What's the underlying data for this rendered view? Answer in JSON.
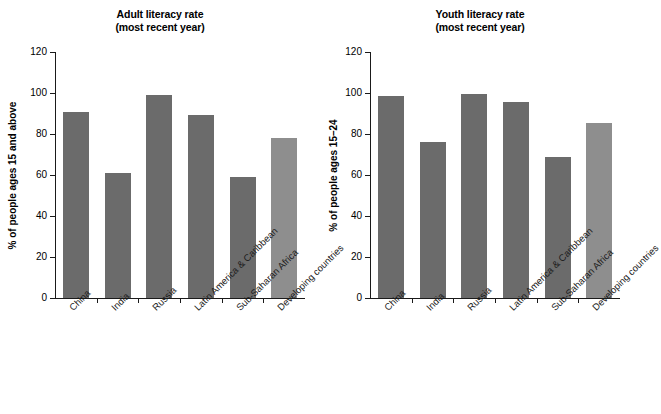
{
  "chart_data": [
    {
      "type": "bar",
      "title": "Adult literacy rate",
      "subtitle": "(most recent year)",
      "xlabel": "",
      "ylabel": "% of people ages 15 and above",
      "ylim": [
        0,
        120
      ],
      "yticks": [
        0,
        20,
        40,
        60,
        80,
        100,
        120
      ],
      "grid": false,
      "legend": "none",
      "categories": [
        "China",
        "India",
        "Russia",
        "Latin America & Caribbean",
        "Sub-Saharan Africa",
        "Developing countries"
      ],
      "values": [
        90.5,
        61,
        99,
        89.5,
        59,
        78
      ],
      "bar_colors": [
        "#6b6b6b",
        "#6b6b6b",
        "#6b6b6b",
        "#6b6b6b",
        "#6b6b6b",
        "#8e8e8e"
      ]
    },
    {
      "type": "bar",
      "title": "Youth literacy rate",
      "subtitle": "(most recent year)",
      "xlabel": "",
      "ylabel": "% of people ages 15–24",
      "ylim": [
        0,
        120
      ],
      "yticks": [
        0,
        20,
        40,
        60,
        80,
        100,
        120
      ],
      "grid": false,
      "legend": "none",
      "categories": [
        "China",
        "India",
        "Russia",
        "Latin America & Caribbean",
        "Sub-Saharan Africa",
        "Developing countries"
      ],
      "values": [
        98.5,
        76,
        99.5,
        95.5,
        69,
        85.5
      ],
      "bar_colors": [
        "#6b6b6b",
        "#6b6b6b",
        "#6b6b6b",
        "#6b6b6b",
        "#6b6b6b",
        "#8e8e8e"
      ]
    }
  ],
  "colors": {
    "background": "#ffffff",
    "axis": "#1a1a1a",
    "bar_dark": "#6b6b6b",
    "bar_light": "#8e8e8e"
  }
}
